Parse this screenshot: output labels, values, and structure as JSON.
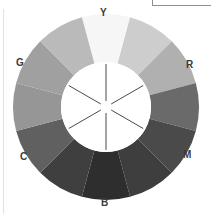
{
  "figure": {
    "background_color": "#ffffff",
    "width": 211,
    "height": 214
  },
  "frame": {
    "top_rule_color": "#8f8f8f",
    "left_edge_color": "#e2e2e2"
  },
  "wheel": {
    "center_x": 106,
    "center_y": 107,
    "outer_radius": 93,
    "inner_radius": 45,
    "hub_fill": "#ffffff",
    "segment_count": 12,
    "spoke_count": 6,
    "spoke_color": "#4a4a4a",
    "spoke_inner_gap": 6,
    "labels": [
      {
        "key": "Y",
        "text": "Y",
        "angle_deg": 270,
        "name": "yellow"
      },
      {
        "key": "R",
        "text": "R",
        "angle_deg": 330,
        "name": "red"
      },
      {
        "key": "M",
        "text": "M",
        "angle_deg": 30,
        "name": "magenta"
      },
      {
        "key": "B",
        "text": "B",
        "angle_deg": 90,
        "name": "blue"
      },
      {
        "key": "C",
        "text": "C",
        "angle_deg": 150,
        "name": "cyan"
      },
      {
        "key": "G",
        "text": "G",
        "angle_deg": 210,
        "name": "green"
      }
    ]
  },
  "chart_data": {
    "type": "pie",
    "xlabel": "",
    "ylabel": "",
    "legend_position": "around-ring",
    "grid": false,
    "categories": [
      "Y",
      "YR",
      "R",
      "RM",
      "M",
      "MB",
      "B",
      "BC",
      "C",
      "CG",
      "G",
      "GY"
    ],
    "values": [
      30,
      30,
      30,
      30,
      30,
      30,
      30,
      30,
      30,
      30,
      30,
      30
    ],
    "series": [
      {
        "name": "luminance",
        "values": [
          246,
          205,
          176,
          106,
          74,
          62,
          46,
          63,
          96,
          150,
          160,
          186
        ]
      }
    ],
    "segments": [
      {
        "label": "Y",
        "primary": true,
        "color": "#f6f6f6",
        "start_deg": 255,
        "end_deg": 285,
        "luminance": 246
      },
      {
        "label": "",
        "primary": false,
        "color": "#cdcdcd",
        "start_deg": 285,
        "end_deg": 315,
        "luminance": 205
      },
      {
        "label": "R",
        "primary": true,
        "color": "#b0b0b0",
        "start_deg": 315,
        "end_deg": 345,
        "luminance": 176
      },
      {
        "label": "",
        "primary": false,
        "color": "#6a6a6a",
        "start_deg": 345,
        "end_deg": 15,
        "luminance": 106
      },
      {
        "label": "M",
        "primary": true,
        "color": "#4a4a4a",
        "start_deg": 15,
        "end_deg": 45,
        "luminance": 74
      },
      {
        "label": "",
        "primary": false,
        "color": "#3e3e3e",
        "start_deg": 45,
        "end_deg": 75,
        "luminance": 62
      },
      {
        "label": "B",
        "primary": true,
        "color": "#2e2e2e",
        "start_deg": 75,
        "end_deg": 105,
        "luminance": 46
      },
      {
        "label": "",
        "primary": false,
        "color": "#3f3f3f",
        "start_deg": 105,
        "end_deg": 135,
        "luminance": 63
      },
      {
        "label": "C",
        "primary": true,
        "color": "#606060",
        "start_deg": 135,
        "end_deg": 165,
        "luminance": 96
      },
      {
        "label": "",
        "primary": false,
        "color": "#969696",
        "start_deg": 165,
        "end_deg": 195,
        "luminance": 150
      },
      {
        "label": "G",
        "primary": true,
        "color": "#a0a0a0",
        "start_deg": 195,
        "end_deg": 225,
        "luminance": 160
      },
      {
        "label": "",
        "primary": false,
        "color": "#bababa",
        "start_deg": 225,
        "end_deg": 255,
        "luminance": 186
      }
    ]
  }
}
